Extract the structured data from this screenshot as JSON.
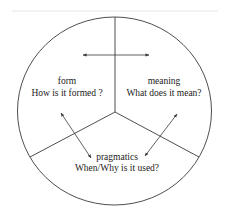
{
  "diagram": {
    "type": "circle-three-sector",
    "colors": {
      "stroke": "#3a3a3a",
      "text": "#222222",
      "top_rule": "#e6e6e6",
      "background": "#ffffff"
    },
    "sections": [
      {
        "id": "form",
        "title": "form",
        "question": "How is it formed ?"
      },
      {
        "id": "meaning",
        "title": "meaning",
        "question": "What does it mean?"
      },
      {
        "id": "pragmatics",
        "title": "pragmatics",
        "question": "When/Why is it used?"
      }
    ],
    "arrows": [
      {
        "from": "form",
        "to": "meaning",
        "bidirectional": true
      },
      {
        "from": "form",
        "to": "pragmatics",
        "bidirectional": true
      },
      {
        "from": "meaning",
        "to": "pragmatics",
        "bidirectional": true
      }
    ]
  }
}
